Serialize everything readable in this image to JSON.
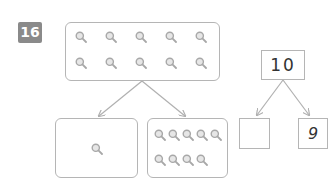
{
  "problem": {
    "number": "16"
  },
  "picture_bond": {
    "whole_count": 10,
    "part_left_count": 1,
    "part_right_count": 9,
    "icon": "magnifying-glass-icon"
  },
  "number_bond": {
    "whole": "10",
    "part_left": "",
    "part_right": "9"
  },
  "colors": {
    "badge": "#8a8a8a",
    "border": "#b5b5b5",
    "icon": "#a8a8a8",
    "arrow": "#b0b0b0"
  }
}
